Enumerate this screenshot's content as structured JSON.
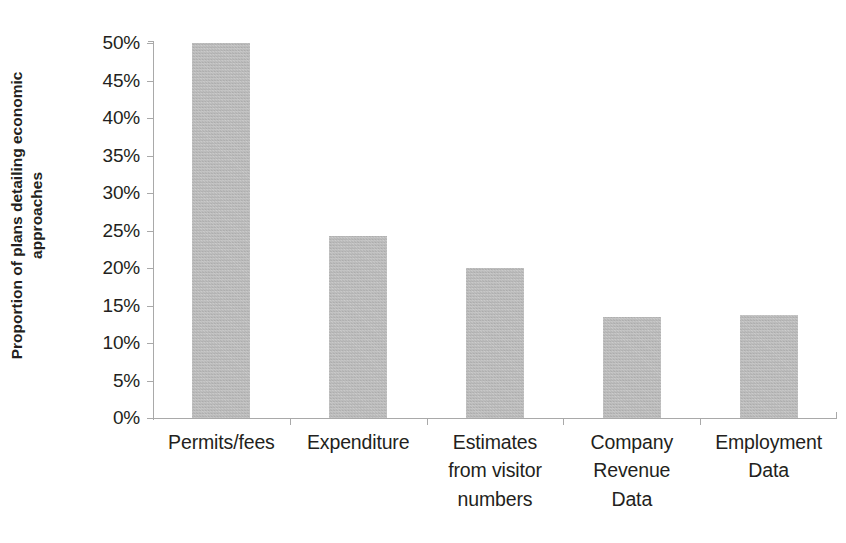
{
  "chart_data": {
    "type": "bar",
    "title": "",
    "subtitle": "",
    "xlabel": "",
    "ylabel": "Proportion of plans detailing economic approaches",
    "ylabel_lines": [
      "Proportion of plans detailing economic",
      "approaches"
    ],
    "categories": [
      "Permits/fees",
      "Expenditure",
      "Estimates from visitor numbers",
      "Company Revenue Data",
      "Employment Data"
    ],
    "category_lines": [
      [
        "Permits/fees"
      ],
      [
        "Expenditure"
      ],
      [
        "Estimates",
        "from visitor",
        "numbers"
      ],
      [
        "Company",
        "Revenue",
        "Data"
      ],
      [
        "Employment",
        "Data"
      ]
    ],
    "values": [
      50.0,
      24.3,
      20.0,
      13.5,
      13.7
    ],
    "value_labels": [
      "50%",
      "24.3%",
      "20%",
      "13.5%",
      "13.7%"
    ],
    "ylim": [
      0,
      50
    ],
    "ytick_values": [
      0,
      5,
      10,
      15,
      20,
      25,
      30,
      35,
      40,
      45,
      50
    ],
    "ytick_labels": [
      "0%",
      "5%",
      "10%",
      "15%",
      "20%",
      "25%",
      "30%",
      "35%",
      "40%",
      "45%",
      "50%"
    ],
    "grid": false,
    "legend": false,
    "legend_position": "none",
    "bar_color": "#b9b9b9",
    "axis_color": "#a9a9a9",
    "text_color": "#231f20",
    "background_color": "#ffffff"
  }
}
